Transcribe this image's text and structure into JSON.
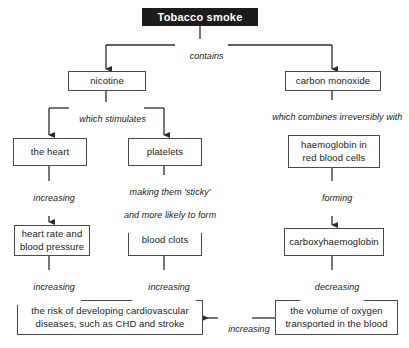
{
  "diagram": {
    "nodes": {
      "tobacco_smoke": "Tobacco smoke",
      "nicotine": "nicotine",
      "carbon_monoxide": "carbon monoxide",
      "the_heart": "the heart",
      "platelets": "platelets",
      "haemoglobin_line1": "haemoglobin in",
      "haemoglobin_line2": "red blood cells",
      "heart_rate_line1": "heart rate and",
      "heart_rate_line2": "blood pressure",
      "blood_clots": "blood clots",
      "carboxyhaemoglobin": "carboxyhaemoglobin",
      "risk_line1": "the risk of developing cardiovascular",
      "risk_line2": "diseases, such as CHD and stroke",
      "oxygen_line1": "the volume of oxygen",
      "oxygen_line2": "transported in the blood"
    },
    "edge_labels": {
      "contains": "contains",
      "which_stimulates": "which stimulates",
      "which_combines": "which combines irreversibly with",
      "increasing_heart": "increasing",
      "making_sticky_line1": "making them 'sticky'",
      "making_sticky_line2": "and more likely to form",
      "forming": "forming",
      "increasing_risk_left": "increasing",
      "increasing_risk_mid": "increasing",
      "decreasing": "decreasing",
      "increasing_oxygen": "increasing"
    },
    "colors": {
      "title_background": "#1c1c1c",
      "title_text": "#ffffff",
      "box_border": "#4a4a4a",
      "box_background": "#ffffff",
      "text": "#1a1a1a",
      "connector": "#2b2b2b"
    }
  }
}
